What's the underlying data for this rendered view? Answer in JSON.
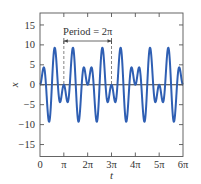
{
  "chart_data": {
    "type": "line",
    "title": "",
    "xlabel": "t",
    "ylabel": "x",
    "xlim_pi": [
      0,
      6
    ],
    "ylim": [
      -18,
      18
    ],
    "grid": false,
    "legend": null,
    "x_ticks": [
      {
        "value_pi": 0,
        "label": "0"
      },
      {
        "value_pi": 1,
        "label": "π"
      },
      {
        "value_pi": 2,
        "label": "2π"
      },
      {
        "value_pi": 3,
        "label": "3π"
      },
      {
        "value_pi": 4,
        "label": "4π"
      },
      {
        "value_pi": 5,
        "label": "5π"
      },
      {
        "value_pi": 6,
        "label": "6π"
      }
    ],
    "y_ticks": [
      {
        "value": 15,
        "label": "15"
      },
      {
        "value": 10,
        "label": "10"
      },
      {
        "value": 5,
        "label": "5"
      },
      {
        "value": 0,
        "label": "0"
      },
      {
        "value": -5,
        "label": "−5"
      },
      {
        "value": -10,
        "label": "−10"
      },
      {
        "value": -15,
        "label": "−15"
      }
    ],
    "series": [
      {
        "name": "x(t)",
        "formula": "x = 10 sin(4t) sin(t) = 5cos(3t) − 5cos(5t)",
        "coef": {
          "a": 5,
          "f1": 3,
          "f2": 5
        },
        "color": "#2f5fb3",
        "key_points": [
          {
            "t_pi": 0,
            "x": 0
          },
          {
            "t_pi": 0.16,
            "x": 4.4
          },
          {
            "t_pi": 0.38,
            "x": -9.3
          },
          {
            "t_pi": 0.62,
            "x": 9.3
          },
          {
            "t_pi": 0.86,
            "x": -4.2
          },
          {
            "t_pi": 1,
            "x": 0
          },
          {
            "t_pi": 1.14,
            "x": -4.2
          },
          {
            "t_pi": 1.38,
            "x": 9.3
          },
          {
            "t_pi": 1.62,
            "x": -9.3
          },
          {
            "t_pi": 1.84,
            "x": 4.4
          },
          {
            "t_pi": 2,
            "x": 0
          }
        ]
      }
    ],
    "annotations": [
      {
        "text": "Period = 2π",
        "type": "double-arrow",
        "from_pi": 1,
        "to_pi": 3,
        "dashed_guides": true
      }
    ]
  }
}
